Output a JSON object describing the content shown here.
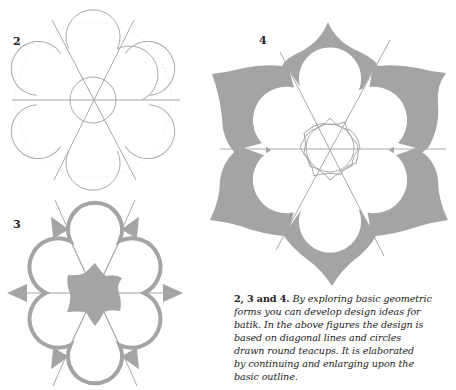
{
  "figures": [
    {
      "label": "2",
      "description": "Six-petal flower outline drawn on diagonal lines with a central circle"
    },
    {
      "label": "3",
      "description": "Six-petal flower with gray outline, gray star center and gray pointed tips"
    },
    {
      "label": "4",
      "description": "Elaborated large gray lotus with white inner petals and interlaced star center"
    }
  ],
  "caption": {
    "bold": "2, 3 and 4.",
    "lines": [
      " By exploring basic geometric",
      "forms you can develop design ideas for",
      "batik. In the above figures the design is",
      "based on diagonal lines and circles",
      "drawn round teacups. It is elaborated",
      "by continuing and enlarging upon the",
      "basic outline."
    ]
  },
  "colors": {
    "fill": "#a4a4a4",
    "line": "#a8a8a8",
    "text": "#222222"
  }
}
